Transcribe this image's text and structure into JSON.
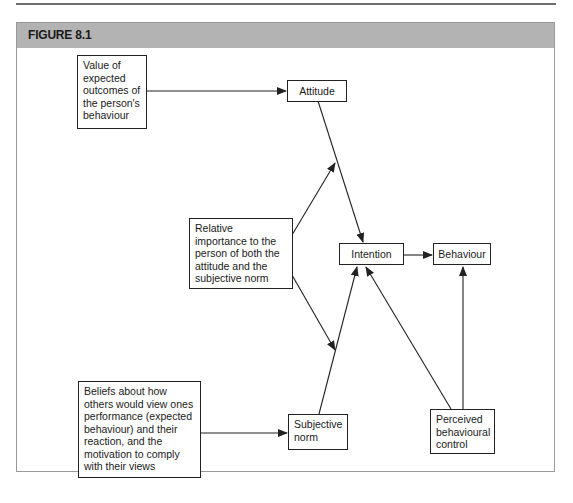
{
  "figure": {
    "title": "FIGURE 8.1"
  },
  "nodes": {
    "value_outcomes": {
      "label": "Value of expected outcomes of the person's behaviour"
    },
    "attitude": {
      "label": "Attitude"
    },
    "relative_importance": {
      "label": "Relative importance to the person of both the attitude and the subjective norm"
    },
    "intention": {
      "label": "Intention"
    },
    "behaviour": {
      "label": "Behaviour"
    },
    "beliefs": {
      "label": "Beliefs about how others would view ones performance (expected behaviour) and their reaction, and the motivation to comply with their views"
    },
    "subjective_norm": {
      "label": "Subjective norm"
    },
    "perceived_control": {
      "label": "Perceived behavioural control"
    }
  },
  "edges": [
    {
      "from": "value_outcomes",
      "to": "attitude"
    },
    {
      "from": "attitude",
      "to": "intention"
    },
    {
      "from": "relative_importance",
      "to": "attitude-intention link"
    },
    {
      "from": "relative_importance",
      "to": "subjective_norm-intention link"
    },
    {
      "from": "subjective_norm",
      "to": "intention"
    },
    {
      "from": "beliefs",
      "to": "subjective_norm"
    },
    {
      "from": "intention",
      "to": "behaviour"
    },
    {
      "from": "perceived_control",
      "to": "intention"
    },
    {
      "from": "perceived_control",
      "to": "behaviour"
    }
  ],
  "colors": {
    "header_bg": "#b3b3b3",
    "line": "#222222",
    "frame_border": "#9a9a9a"
  }
}
